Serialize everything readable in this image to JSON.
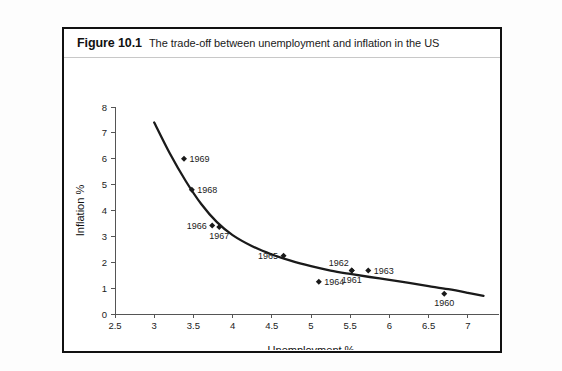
{
  "figure": {
    "number": "Figure 10.1",
    "caption": "The trade-off between unemployment and inflation in the US"
  },
  "chart_data": {
    "type": "scatter",
    "title": "The trade-off between unemployment and inflation in the US",
    "xlabel": "Unemployment %",
    "ylabel": "Inflation %",
    "xlim": [
      2.5,
      7.5
    ],
    "ylim": [
      0,
      8
    ],
    "xticks": [
      "2.5",
      "3",
      "3.5",
      "4",
      "4.5",
      "5",
      "5.5",
      "6",
      "6.5",
      "7",
      "7.5"
    ],
    "xtick_values": [
      2.5,
      3,
      3.5,
      4,
      4.5,
      5,
      5.5,
      6,
      6.5,
      7,
      7.5
    ],
    "yticks": [
      "0",
      "1",
      "2",
      "3",
      "4",
      "5",
      "6",
      "7",
      "8"
    ],
    "ytick_values": [
      0,
      1,
      2,
      3,
      4,
      5,
      6,
      7,
      8
    ],
    "grid": false,
    "legend": false,
    "marker_shape": "diamond",
    "marker_color": "#1a1a1a",
    "curve_color": "#1a1a1a",
    "points": [
      {
        "label": "1969",
        "x": 3.38,
        "y": 6.0,
        "label_pos": "right"
      },
      {
        "label": "1968",
        "x": 3.48,
        "y": 4.8,
        "label_pos": "right"
      },
      {
        "label": "1966",
        "x": 3.74,
        "y": 3.42,
        "label_pos": "left"
      },
      {
        "label": "1967",
        "x": 3.83,
        "y": 3.36,
        "label_pos": "below"
      },
      {
        "label": "1965",
        "x": 4.65,
        "y": 2.25,
        "label_pos": "left"
      },
      {
        "label": "1962",
        "x": 5.52,
        "y": 1.68,
        "label_pos": "above-left"
      },
      {
        "label": "1963",
        "x": 5.73,
        "y": 1.68,
        "label_pos": "right"
      },
      {
        "label": "1961",
        "x": 5.52,
        "y": 1.68,
        "label_pos": "below"
      },
      {
        "label": "1964",
        "x": 5.1,
        "y": 1.25,
        "label_pos": "right"
      },
      {
        "label": "1960",
        "x": 6.7,
        "y": 0.78,
        "label_pos": "below"
      }
    ],
    "curve": {
      "name": "Phillips curve",
      "x": [
        3.0,
        3.2,
        3.4,
        3.6,
        3.8,
        4.0,
        4.25,
        4.5,
        4.75,
        5.0,
        5.25,
        5.5,
        5.75,
        6.0,
        6.25,
        6.5,
        6.75,
        7.0,
        7.2
      ],
      "y": [
        7.4,
        6.2,
        5.15,
        4.25,
        3.55,
        3.05,
        2.62,
        2.3,
        2.05,
        1.85,
        1.68,
        1.55,
        1.43,
        1.32,
        1.2,
        1.08,
        0.96,
        0.82,
        0.7
      ]
    }
  }
}
